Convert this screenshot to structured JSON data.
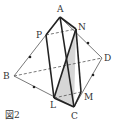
{
  "figure": {
    "caption": "図2",
    "labels": {
      "A": "A",
      "N": "N",
      "P": "P",
      "D": "D",
      "B": "B",
      "L": "L",
      "M": "M",
      "C": "C"
    },
    "colors": {
      "line": "#222222",
      "shade": "#cfcfcf",
      "thin": "#555555"
    }
  }
}
